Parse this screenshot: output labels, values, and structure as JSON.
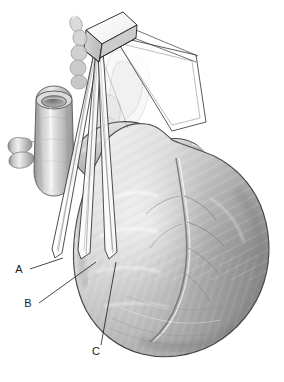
{
  "figure": {
    "domain_note": "grayscale medical line-and-tone anatomical illustration",
    "background_color": "#ffffff",
    "ink_color": "#1a1a1a",
    "tone_light": "#e8e8e8",
    "tone_mid": "#b4b4b4",
    "tone_dark": "#8a8a8a",
    "tone_shadow": "#6e6e6e"
  },
  "labels": [
    {
      "id": "A",
      "text": "A",
      "x": 19,
      "y": 273,
      "leader_from_x": 30,
      "leader_from_y": 269,
      "leader_to_x": 63,
      "leader_to_y": 258
    },
    {
      "id": "B",
      "text": "B",
      "x": 28,
      "y": 307,
      "leader_from_x": 39,
      "leader_from_y": 303,
      "leader_to_x": 96,
      "leader_to_y": 262
    },
    {
      "id": "C",
      "text": "C",
      "x": 96,
      "y": 355,
      "leader_from_x": 101,
      "leader_from_y": 345,
      "leader_to_x": 116,
      "leader_to_y": 262
    }
  ],
  "structures": [
    {
      "name": "ultrasound-transducer-probe",
      "description": "three-dimensional wireframe rectangular box at apex of scan planes"
    },
    {
      "name": "scan-plane-a",
      "description": "narrow translucent wedge, leftmost, labeled A"
    },
    {
      "name": "scan-plane-b",
      "description": "narrow translucent wedge, middle, labeled B"
    },
    {
      "name": "scan-plane-c",
      "description": "narrow translucent wedge, rightmost, labeled C"
    },
    {
      "name": "reference-plane",
      "description": "large translucent quadrilateral plane extending to upper right"
    },
    {
      "name": "great-vessel",
      "description": "cut great vessel with open lumen at upper left"
    },
    {
      "name": "vessel-branch",
      "description": "small branching vessel stub on left"
    },
    {
      "name": "atrial-appendage",
      "description": "lobulated atrial appendage on upper right of heart"
    },
    {
      "name": "ventricular-myocardium",
      "description": "large ventricular mass with fiber striations"
    },
    {
      "name": "ghosted-chambers",
      "description": "faint internal cardiac chambers seen through translucent plane"
    },
    {
      "name": "cardiac-apex",
      "description": "rounded inferior apex of the heart"
    }
  ]
}
